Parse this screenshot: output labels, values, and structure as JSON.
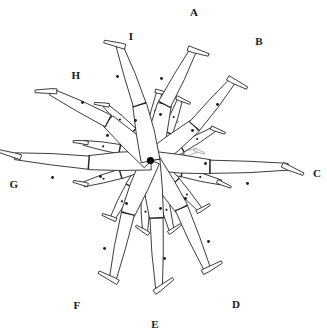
{
  "figure": {
    "background_color": "#ffffff",
    "stroke_color": "#1a1a1a",
    "faint_stroke_color": "#8d8d8d",
    "hub_color": "#000000",
    "width": 327,
    "height": 334,
    "hub": {
      "x": 150.5,
      "y": 160.5,
      "r": 3.6,
      "name": "hip-joint"
    }
  },
  "labels": [
    {
      "id": "A",
      "text": "A",
      "x": 194,
      "y": 13
    },
    {
      "id": "B",
      "text": "B",
      "x": 259,
      "y": 42
    },
    {
      "id": "C",
      "text": "C",
      "x": 317,
      "y": 174
    },
    {
      "id": "D",
      "text": "D",
      "x": 236,
      "y": 305
    },
    {
      "id": "E",
      "text": "E",
      "x": 155,
      "y": 325
    },
    {
      "id": "F",
      "text": "F",
      "x": 77,
      "y": 306
    },
    {
      "id": "G",
      "text": "G",
      "x": 14,
      "y": 185
    },
    {
      "id": "H",
      "text": "H",
      "x": 76,
      "y": 76
    },
    {
      "id": "I",
      "text": "I",
      "x": 131,
      "y": 37
    }
  ],
  "legs": [
    {
      "id": "A",
      "labeled": true,
      "prominent": true,
      "angle_deg": -76,
      "thigh_length": 58,
      "shank_length": 62,
      "knee_flex_deg": 14,
      "thigh_com": {
        "x": 160.5,
        "y": 114.5
      },
      "shank_com": {
        "x": 161.5,
        "y": 78.5
      },
      "foot_dir_deg": 20,
      "foot_length": 16
    },
    {
      "id": "B",
      "labeled": true,
      "prominent": true,
      "angle_deg": -38,
      "thigh_length": 56,
      "shank_length": 60,
      "knee_flex_deg": -12,
      "thigh_com": {
        "x": 192.5,
        "y": 130.5
      },
      "shank_com": {
        "x": 217.5,
        "y": 104.5
      },
      "foot_dir_deg": 30,
      "foot_length": 16
    },
    {
      "id": "C",
      "labeled": true,
      "prominent": true,
      "angle_deg": 6,
      "thigh_length": 60,
      "shank_length": 78,
      "knee_flex_deg": -6,
      "thigh_com": {
        "x": 205.5,
        "y": 163.5
      },
      "shank_com": {
        "x": 247.5,
        "y": 183.5
      },
      "foot_dir_deg": 26,
      "foot_length": 17
    },
    {
      "id": "D",
      "labeled": true,
      "prominent": true,
      "angle_deg": 57,
      "thigh_length": 57,
      "shank_length": 66,
      "knee_flex_deg": 10,
      "thigh_com": {
        "x": 185.5,
        "y": 198.5
      },
      "shank_com": {
        "x": 208.5,
        "y": 241.5
      },
      "foot_dir_deg": -26,
      "foot_length": 16
    },
    {
      "id": "E",
      "labeled": true,
      "prominent": true,
      "angle_deg": 84,
      "thigh_length": 58,
      "shank_length": 70,
      "knee_flex_deg": 4,
      "thigh_com": {
        "x": 160.5,
        "y": 208.5
      },
      "shank_com": {
        "x": 164.5,
        "y": 258.5
      },
      "foot_dir_deg": -34,
      "foot_length": 17
    },
    {
      "id": "F",
      "labeled": true,
      "prominent": true,
      "angle_deg": 113,
      "thigh_length": 58,
      "shank_length": 68,
      "knee_flex_deg": -10,
      "thigh_com": {
        "x": 126.5,
        "y": 203.5
      },
      "shank_com": {
        "x": 104.5,
        "y": 248.5
      },
      "foot_dir_deg": -150,
      "foot_length": 16
    },
    {
      "id": "G",
      "labeled": true,
      "prominent": true,
      "angle_deg": 178,
      "thigh_length": 62,
      "shank_length": 74,
      "knee_flex_deg": 7,
      "thigh_com": {
        "x": 100.5,
        "y": 176.5
      },
      "shank_com": {
        "x": 52.5,
        "y": 177.5
      },
      "foot_dir_deg": 198,
      "foot_length": 17
    },
    {
      "id": "H",
      "labeled": true,
      "prominent": true,
      "angle_deg": -137,
      "thigh_length": 58,
      "shank_length": 64,
      "knee_flex_deg": -16,
      "thigh_com": {
        "x": 107.5,
        "y": 135.5
      },
      "shank_com": {
        "x": 82.5,
        "y": 102.5
      },
      "foot_dir_deg": 182,
      "foot_length": 16
    },
    {
      "id": "I",
      "labeled": true,
      "prominent": true,
      "angle_deg": -101,
      "thigh_length": 57,
      "shank_length": 62,
      "knee_flex_deg": -8,
      "thigh_com": {
        "x": 135.5,
        "y": 120.5
      },
      "shank_com": {
        "x": 117.5,
        "y": 76.5
      },
      "foot_dir_deg": 196,
      "foot_length": 16
    },
    {
      "id": "s1",
      "labeled": false,
      "prominent": false,
      "angle_deg": -122,
      "thigh_length": 34,
      "shank_length": 38,
      "knee_flex_deg": -14,
      "foot_dir_deg": 190,
      "foot_length": 11
    },
    {
      "id": "s2",
      "labeled": false,
      "prominent": false,
      "angle_deg": -88,
      "thigh_length": 33,
      "shank_length": 37,
      "knee_flex_deg": 10,
      "foot_dir_deg": 16,
      "foot_length": 11
    },
    {
      "id": "s3",
      "labeled": false,
      "prominent": false,
      "angle_deg": -58,
      "thigh_length": 33,
      "shank_length": 36,
      "knee_flex_deg": -12,
      "foot_dir_deg": 26,
      "foot_length": 11
    },
    {
      "id": "s4",
      "labeled": false,
      "prominent": false,
      "angle_deg": -22,
      "thigh_length": 34,
      "shank_length": 38,
      "knee_flex_deg": -8,
      "foot_dir_deg": 24,
      "foot_length": 11
    },
    {
      "id": "s5",
      "labeled": false,
      "prominent": false,
      "angle_deg": 20,
      "thigh_length": 34,
      "shank_length": 40,
      "knee_flex_deg": -5,
      "foot_dir_deg": 26,
      "foot_length": 11
    },
    {
      "id": "s6",
      "labeled": false,
      "prominent": false,
      "angle_deg": 40,
      "thigh_length": 33,
      "shank_length": 37,
      "knee_flex_deg": 9,
      "foot_dir_deg": -28,
      "foot_length": 11
    },
    {
      "id": "s7",
      "labeled": false,
      "prominent": false,
      "angle_deg": 70,
      "thigh_length": 34,
      "shank_length": 39,
      "knee_flex_deg": 6,
      "foot_dir_deg": -32,
      "foot_length": 11
    },
    {
      "id": "s8",
      "labeled": false,
      "prominent": false,
      "angle_deg": 98,
      "thigh_length": 34,
      "shank_length": 38,
      "knee_flex_deg": -7,
      "foot_dir_deg": -146,
      "foot_length": 11
    },
    {
      "id": "s9",
      "labeled": false,
      "prominent": false,
      "angle_deg": 128,
      "thigh_length": 33,
      "shank_length": 37,
      "knee_flex_deg": -9,
      "foot_dir_deg": -156,
      "foot_length": 11
    },
    {
      "id": "s10",
      "labeled": false,
      "prominent": false,
      "angle_deg": 156,
      "thigh_length": 33,
      "shank_length": 38,
      "knee_flex_deg": 8,
      "foot_dir_deg": 196,
      "foot_length": 11
    },
    {
      "id": "s11",
      "labeled": false,
      "prominent": false,
      "angle_deg": -160,
      "thigh_length": 33,
      "shank_length": 36,
      "knee_flex_deg": -10,
      "foot_dir_deg": 188,
      "foot_length": 11
    },
    {
      "id": "t1",
      "labeled": false,
      "prominent": false,
      "faint": true,
      "angle_deg": -70,
      "thigh_length": 22,
      "shank_length": 24,
      "knee_flex_deg": 12,
      "foot_dir_deg": 18,
      "foot_length": 8
    },
    {
      "id": "t2",
      "labeled": false,
      "prominent": false,
      "faint": true,
      "angle_deg": -8,
      "thigh_length": 22,
      "shank_length": 26,
      "knee_flex_deg": -8,
      "foot_dir_deg": 24,
      "foot_length": 8
    },
    {
      "id": "t3",
      "labeled": false,
      "prominent": false,
      "faint": true,
      "angle_deg": 52,
      "thigh_length": 22,
      "shank_length": 24,
      "knee_flex_deg": 8,
      "foot_dir_deg": -30,
      "foot_length": 8
    },
    {
      "id": "t4",
      "labeled": false,
      "prominent": false,
      "faint": true,
      "angle_deg": 112,
      "thigh_length": 22,
      "shank_length": 24,
      "knee_flex_deg": -8,
      "foot_dir_deg": -150,
      "foot_length": 8
    },
    {
      "id": "t5",
      "labeled": false,
      "prominent": false,
      "faint": true,
      "angle_deg": 172,
      "thigh_length": 22,
      "shank_length": 25,
      "knee_flex_deg": 8,
      "foot_dir_deg": 194,
      "foot_length": 8
    }
  ]
}
